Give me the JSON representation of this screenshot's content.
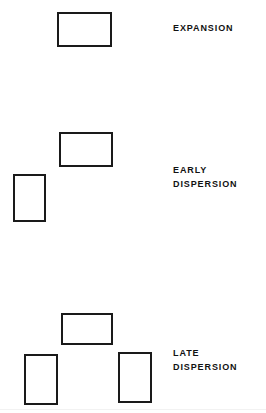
{
  "figure": {
    "background_color": "#ffffff",
    "stroke_color": "#1a1a1a",
    "text_color": "#121212",
    "stroke_width_px": 2
  },
  "groups": [
    {
      "id": "expansion",
      "label": "EXPANSION",
      "label_lines": [
        "EXPANSION"
      ],
      "label_x": 173,
      "label_y": 22,
      "boxes": [
        {
          "name": "expansion-box-1",
          "orientation": "horizontal",
          "x": 57,
          "y": 12,
          "width": 55,
          "height": 35
        }
      ]
    },
    {
      "id": "early-dispersion",
      "label": "EARLY DISPERSION",
      "label_lines": [
        "EARLY",
        "DISPERSION"
      ],
      "label_x": 173,
      "label_y": 164,
      "boxes": [
        {
          "name": "early-dispersion-box-1",
          "orientation": "horizontal",
          "x": 59,
          "y": 132,
          "width": 54,
          "height": 35
        },
        {
          "name": "early-dispersion-box-2",
          "orientation": "vertical",
          "x": 13,
          "y": 174,
          "width": 33,
          "height": 48
        }
      ]
    },
    {
      "id": "late-dispersion",
      "label": "LATE DISPERSION",
      "label_lines": [
        "LATE",
        "DISPERSION"
      ],
      "label_x": 173,
      "label_y": 347,
      "boxes": [
        {
          "name": "late-dispersion-box-1",
          "orientation": "horizontal",
          "x": 61,
          "y": 313,
          "width": 52,
          "height": 32
        },
        {
          "name": "late-dispersion-box-2",
          "orientation": "vertical",
          "x": 24,
          "y": 354,
          "width": 34,
          "height": 51
        },
        {
          "name": "late-dispersion-box-3",
          "orientation": "vertical",
          "x": 118,
          "y": 352,
          "width": 34,
          "height": 51
        }
      ]
    }
  ],
  "artifacts": [
    {
      "name": "scan-line",
      "y": 409
    }
  ]
}
